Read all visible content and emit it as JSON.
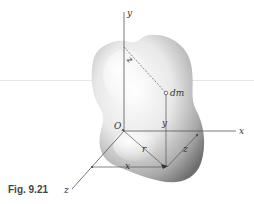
{
  "figure": {
    "caption": "Fig. 9.21",
    "axes": {
      "x_label": "x",
      "y_label": "y",
      "z_label": "z",
      "origin_label": "O"
    },
    "element": {
      "mass_label": "dm"
    },
    "distances": {
      "r_label": "r",
      "x_label": "x",
      "y_label": "y",
      "z_label": "z",
      "rz_label": "z"
    },
    "colors": {
      "line": "#555555",
      "body_light": "#ffffff",
      "body_dark": "#6e6e6e"
    }
  }
}
